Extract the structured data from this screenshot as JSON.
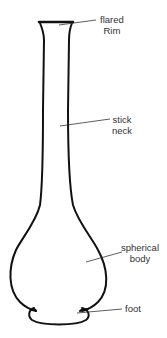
{
  "diagram": {
    "labels": [
      {
        "id": "rim",
        "line1": "flared",
        "line2": "Rim"
      },
      {
        "id": "neck",
        "line1": "stick",
        "line2": "neck"
      },
      {
        "id": "body",
        "line1": "spherical",
        "line2": "body"
      },
      {
        "id": "foot",
        "line1": "foot",
        "line2": ""
      }
    ]
  }
}
